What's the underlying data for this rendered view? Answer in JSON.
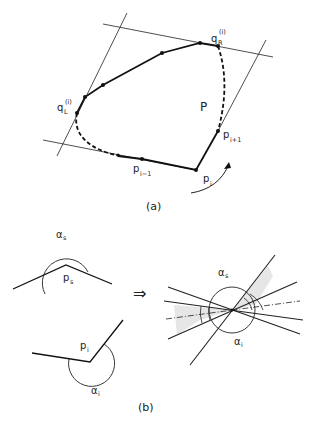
{
  "panel_a": {
    "caption": "(a)",
    "polygon_label": "P",
    "labels": {
      "qR": {
        "base": "q",
        "sub": "R",
        "sup": "(i)"
      },
      "qL": {
        "base": "q",
        "sub": "L",
        "sup": "(i)"
      },
      "p_prev": {
        "base": "p",
        "sub": "i−1"
      },
      "p_cur": {
        "base": "p",
        "sub": "i"
      },
      "p_next": {
        "base": "p",
        "sub": "i+1"
      }
    }
  },
  "panel_b": {
    "caption": "(b)",
    "labels": {
      "alpha_s": {
        "base": "α",
        "sub": "s"
      },
      "p_s": {
        "base": "p",
        "sub": "s"
      },
      "p_i": {
        "base": "p",
        "sub": "i"
      },
      "alpha_i": {
        "base": "α",
        "sub": "i"
      },
      "alpha_s_combined": {
        "base": "α",
        "sub": "s"
      },
      "alpha_i_combined": {
        "base": "α",
        "sub": "i"
      }
    },
    "arrow": "⇒"
  }
}
